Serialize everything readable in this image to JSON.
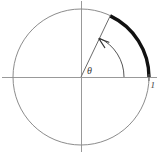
{
  "figure": {
    "background_color": "#ffffff",
    "labels": {
      "angle_symbol": "θ",
      "radius_value": "1"
    },
    "colors": {
      "axis": "#999999",
      "circle": "#8c8c8c",
      "highlight_arc": "#111111",
      "radius_line": "#6b6b6b",
      "angle_arc": "#555555",
      "label_text": "#3a3a3a"
    },
    "geometry": {
      "center_x": 81,
      "center_y": 77,
      "circle_radius": 68,
      "angle_arc_radius": 43,
      "angle_degrees": 64,
      "highlight_arc_start_degrees": 0,
      "highlight_arc_end_degrees": 64,
      "rotation_direction": "counterclockwise"
    },
    "elements": {
      "x_axis": "horizontal-axis",
      "y_axis": "vertical-axis",
      "circle": "unit-circle",
      "terminal_ray": "terminal-side-radius",
      "arc_sweep": "highlighted-arc-length",
      "direction_arrow": "counterclockwise-arrowhead"
    }
  }
}
